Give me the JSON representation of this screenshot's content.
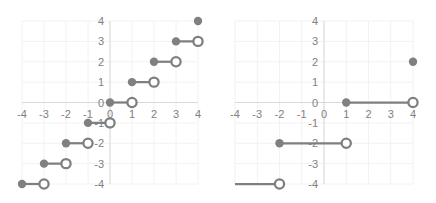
{
  "chart_data": [
    {
      "type": "scatter",
      "title": "",
      "xlabel": "",
      "ylabel": "",
      "xlim": [
        -4,
        4
      ],
      "ylim": [
        -4,
        4
      ],
      "grid": true,
      "x_ticks": [
        "-4",
        "-3",
        "-2",
        "-1",
        "0",
        "1",
        "2",
        "3",
        "4"
      ],
      "y_ticks": [
        "4",
        "3",
        "2",
        "1",
        "0",
        "-1",
        "-2",
        "-3",
        "-4"
      ],
      "description": "Step function (floor-like): closed dot at left end, open circle at right end",
      "segments": [
        {
          "x_start": -4,
          "x_end": -3,
          "y": -4,
          "start": "closed",
          "end": "open"
        },
        {
          "x_start": -3,
          "x_end": -2,
          "y": -3,
          "start": "closed",
          "end": "open"
        },
        {
          "x_start": -2,
          "x_end": -1,
          "y": -2,
          "start": "closed",
          "end": "open"
        },
        {
          "x_start": -1,
          "x_end": 0,
          "y": -1,
          "start": "closed",
          "end": "open"
        },
        {
          "x_start": 0,
          "x_end": 1,
          "y": 0,
          "start": "closed",
          "end": "open"
        },
        {
          "x_start": 1,
          "x_end": 2,
          "y": 1,
          "start": "closed",
          "end": "open"
        },
        {
          "x_start": 2,
          "x_end": 3,
          "y": 2,
          "start": "closed",
          "end": "open"
        },
        {
          "x_start": 3,
          "x_end": 4,
          "y": 3,
          "start": "closed",
          "end": "open"
        }
      ],
      "points": [
        {
          "x": 4,
          "y": 4,
          "style": "closed"
        }
      ]
    },
    {
      "type": "scatter",
      "title": "",
      "xlabel": "",
      "ylabel": "",
      "xlim": [
        -4,
        4
      ],
      "ylim": [
        -4,
        4
      ],
      "grid": true,
      "x_ticks": [
        "-4",
        "-3",
        "-2",
        "-1",
        "0",
        "1",
        "2",
        "3",
        "4"
      ],
      "y_ticks": [
        "4",
        "3",
        "2",
        "1",
        "0",
        "-1",
        "-2",
        "-3",
        "-4"
      ],
      "description": "Step function with width-3 steps: closed dot at left end, open circle at right end",
      "segments": [
        {
          "x_start": -4,
          "x_end": -2,
          "y": -4,
          "start": "none",
          "end": "open"
        },
        {
          "x_start": -2,
          "x_end": 1,
          "y": -2,
          "start": "closed",
          "end": "open"
        },
        {
          "x_start": 1,
          "x_end": 4,
          "y": 0,
          "start": "closed",
          "end": "open"
        }
      ],
      "points": [
        {
          "x": 4,
          "y": 2,
          "style": "closed"
        }
      ]
    }
  ],
  "colors": {
    "series": "#7f7f7f",
    "marker_fill": "#808080",
    "grid": "#f2f2f2",
    "axis": "#d9d9d9",
    "tick_label": "#7f7f7f"
  },
  "layout": {
    "charts": [
      {
        "x_px_min": 22,
        "x_px_max": 198,
        "y_px_top": 21,
        "y_px_bottom": 184,
        "tick_y": 118,
        "ylabel_x": 104,
        "yaxis_label_anchor": "end"
      },
      {
        "x_px_min": 235,
        "x_px_max": 413,
        "y_px_top": 21,
        "y_px_bottom": 184,
        "tick_y": 118,
        "ylabel_x": 318,
        "yaxis_label_anchor": "end"
      }
    ]
  }
}
